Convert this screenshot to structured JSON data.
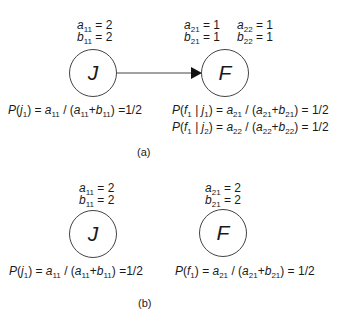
{
  "panel_a": {
    "caption": "(a)",
    "node_j": {
      "label": "J",
      "a_name": "a",
      "a_sub": "11",
      "a_value": "2",
      "b_name": "b",
      "b_sub": "11",
      "b_value": "2",
      "prob": {
        "lhs": "P(j",
        "lhs_sub": "1",
        "rhs": ") = a",
        "rhs_sub": "11",
        "mid": " / (a",
        "mid_sub": "11",
        "plus": "+b",
        "plus_sub": "11",
        "end": ") =1/2"
      }
    },
    "node_f": {
      "label": "F",
      "a1_name": "a",
      "a1_sub": "21",
      "a1_value": "1",
      "b1_name": "b",
      "b1_sub": "21",
      "b1_value": "1",
      "a2_name": "a",
      "a2_sub": "22",
      "a2_value": "1",
      "b2_name": "b",
      "b2_sub": "22",
      "b2_value": "1",
      "prob1": {
        "f_sub": "1",
        "j_sub": "1",
        "a_sub": "21",
        "a2_sub": "21",
        "b_sub": "21",
        "result": "1/2"
      },
      "prob2": {
        "f_sub": "1",
        "j_sub": "2",
        "a_sub": "22",
        "a2_sub": "22",
        "b_sub": "22",
        "result": "1/2"
      }
    },
    "edge": {
      "from": "J",
      "to": "F"
    }
  },
  "panel_b": {
    "caption": "(b)",
    "node_j": {
      "label": "J",
      "a_sub": "11",
      "a_value": "2",
      "b_sub": "11",
      "b_value": "2",
      "prob": {
        "j_sub": "1",
        "a_sub": "11",
        "a2_sub": "11",
        "b_sub": "11",
        "result": "1/2"
      }
    },
    "node_f": {
      "label": "F",
      "a_sub": "21",
      "a_value": "2",
      "b_sub": "21",
      "b_value": "2",
      "prob": {
        "f_sub": "1",
        "a_sub": "21",
        "a2_sub": "21",
        "b_sub": "21",
        "result": "1/2"
      }
    }
  },
  "colors": {
    "stroke": "#444444",
    "text": "#1a1a1a",
    "background": "#ffffff"
  }
}
